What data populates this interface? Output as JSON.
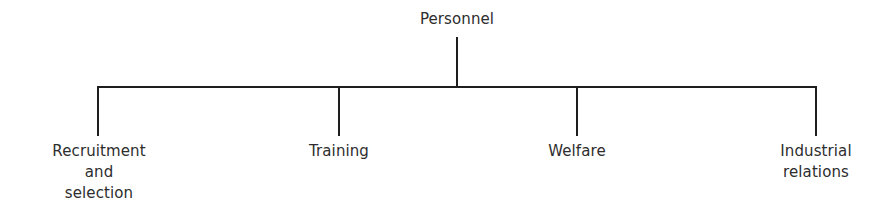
{
  "diagram": {
    "type": "org-chart",
    "root": {
      "label": "Personnel"
    },
    "children": [
      {
        "lines": [
          "Recruitment",
          "and",
          "selection"
        ]
      },
      {
        "lines": [
          "Training"
        ]
      },
      {
        "lines": [
          "Welfare"
        ]
      },
      {
        "lines": [
          "Industrial",
          "relations"
        ]
      }
    ],
    "line_color": "#1e1e1e",
    "text_color": "#2d2d2d"
  }
}
